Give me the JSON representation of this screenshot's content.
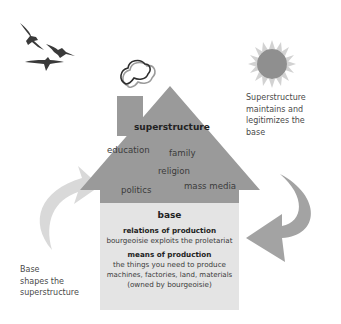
{
  "superstructure": {
    "title": "superstructure",
    "items": [
      "education",
      "family",
      "religion",
      "politics",
      "mass media"
    ]
  },
  "base": {
    "title": "base",
    "relations_title": "relations of production",
    "relations_text": "bourgeoisie exploits the proletariat",
    "means_title": "means of production",
    "means_line1": "the things you need to produce",
    "means_line2": "machines, factories, land, materials",
    "means_line3": "(owned by bourgeoisie)"
  },
  "captions": {
    "right": [
      "Superstructure",
      "maintains and",
      "legitimizes the",
      "base"
    ],
    "left": [
      "Base",
      "shapes the",
      "superstructure"
    ]
  },
  "icons": {
    "birds": "birds-icon",
    "sun": "sun-icon",
    "smoke": "smoke-icon",
    "arrow_left": "curved-arrow-up-icon",
    "arrow_right": "curved-arrow-down-icon"
  },
  "colors": {
    "roof_and_superstructure": "#9a9a9a",
    "base_area": "#e4e4e4",
    "arrow_left": "#d9d9d9",
    "arrow_right": "#a3a3a3",
    "sun_core": "#8f8f8f",
    "sun_rays": "#cfcfcf",
    "birds": "#3a3a3a"
  }
}
